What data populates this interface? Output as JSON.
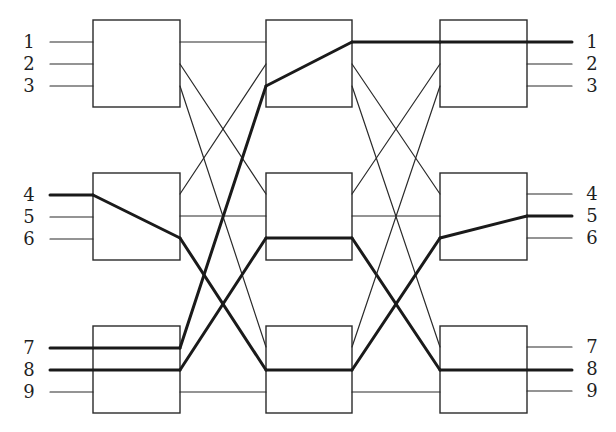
{
  "diagram": {
    "colors": {
      "line": "#2a2a2a",
      "highlight": "#1a1a1a",
      "background": "#ffffff"
    },
    "stages": [
      {
        "name": "input-stage",
        "switches": [
          {
            "id": "L1",
            "x": 93,
            "y": 20,
            "w": 87,
            "h": 87
          },
          {
            "id": "L2",
            "x": 93,
            "y": 173,
            "w": 87,
            "h": 87
          },
          {
            "id": "L3",
            "x": 93,
            "y": 326,
            "w": 87,
            "h": 87
          }
        ]
      },
      {
        "name": "middle-stage",
        "switches": [
          {
            "id": "M1",
            "x": 266,
            "y": 20,
            "w": 86,
            "h": 87
          },
          {
            "id": "M2",
            "x": 266,
            "y": 173,
            "w": 86,
            "h": 87
          },
          {
            "id": "M3",
            "x": 266,
            "y": 326,
            "w": 86,
            "h": 87
          }
        ]
      },
      {
        "name": "output-stage",
        "switches": [
          {
            "id": "R1",
            "x": 440,
            "y": 20,
            "w": 87,
            "h": 87
          },
          {
            "id": "R2",
            "x": 440,
            "y": 173,
            "w": 87,
            "h": 87
          },
          {
            "id": "R3",
            "x": 440,
            "y": 326,
            "w": 87,
            "h": 87
          }
        ]
      }
    ],
    "input_labels": [
      {
        "text": "1",
        "y": 42
      },
      {
        "text": "2",
        "y": 64
      },
      {
        "text": "3",
        "y": 86
      },
      {
        "text": "4",
        "y": 195
      },
      {
        "text": "5",
        "y": 217
      },
      {
        "text": "6",
        "y": 239
      },
      {
        "text": "7",
        "y": 348
      },
      {
        "text": "8",
        "y": 370
      },
      {
        "text": "9",
        "y": 392
      }
    ],
    "output_labels": [
      {
        "text": "1",
        "y": 42
      },
      {
        "text": "2",
        "y": 64
      },
      {
        "text": "3",
        "y": 86
      },
      {
        "text": "4",
        "y": 194
      },
      {
        "text": "5",
        "y": 216
      },
      {
        "text": "6",
        "y": 238
      },
      {
        "text": "7",
        "y": 347
      },
      {
        "text": "8",
        "y": 369
      },
      {
        "text": "9",
        "y": 391
      }
    ],
    "label_x": {
      "left": 29,
      "right": 592
    },
    "wires": [
      {
        "x1": 50,
        "y1": 42,
        "x2": 93,
        "y2": 42,
        "thick": false
      },
      {
        "x1": 50,
        "y1": 64,
        "x2": 93,
        "y2": 64,
        "thick": false
      },
      {
        "x1": 50,
        "y1": 86,
        "x2": 93,
        "y2": 86,
        "thick": false
      },
      {
        "x1": 50,
        "y1": 195,
        "x2": 93,
        "y2": 195,
        "thick": true
      },
      {
        "x1": 50,
        "y1": 217,
        "x2": 93,
        "y2": 217,
        "thick": false
      },
      {
        "x1": 50,
        "y1": 239,
        "x2": 93,
        "y2": 239,
        "thick": false
      },
      {
        "x1": 50,
        "y1": 348,
        "x2": 180,
        "y2": 348,
        "thick": true
      },
      {
        "x1": 50,
        "y1": 370,
        "x2": 180,
        "y2": 370,
        "thick": true
      },
      {
        "x1": 50,
        "y1": 392,
        "x2": 93,
        "y2": 392,
        "thick": false
      },
      {
        "x1": 93,
        "y1": 195,
        "x2": 180,
        "y2": 238,
        "thick": true
      },
      {
        "x1": 180,
        "y1": 42,
        "x2": 266,
        "y2": 42,
        "thick": false
      },
      {
        "x1": 180,
        "y1": 64,
        "x2": 266,
        "y2": 194,
        "thick": false
      },
      {
        "x1": 180,
        "y1": 86,
        "x2": 266,
        "y2": 347,
        "thick": false
      },
      {
        "x1": 180,
        "y1": 194,
        "x2": 266,
        "y2": 64,
        "thick": false
      },
      {
        "x1": 180,
        "y1": 216,
        "x2": 266,
        "y2": 216,
        "thick": false
      },
      {
        "x1": 180,
        "y1": 238,
        "x2": 266,
        "y2": 370,
        "thick": true
      },
      {
        "x1": 180,
        "y1": 348,
        "x2": 266,
        "y2": 86,
        "thick": true
      },
      {
        "x1": 180,
        "y1": 370,
        "x2": 266,
        "y2": 238,
        "thick": true
      },
      {
        "x1": 180,
        "y1": 392,
        "x2": 266,
        "y2": 392,
        "thick": false
      },
      {
        "x1": 266,
        "y1": 86,
        "x2": 352,
        "y2": 42,
        "thick": true
      },
      {
        "x1": 266,
        "y1": 238,
        "x2": 352,
        "y2": 238,
        "thick": true
      },
      {
        "x1": 266,
        "y1": 370,
        "x2": 352,
        "y2": 370,
        "thick": true
      },
      {
        "x1": 352,
        "y1": 42,
        "x2": 440,
        "y2": 42,
        "thick": true
      },
      {
        "x1": 352,
        "y1": 64,
        "x2": 440,
        "y2": 194,
        "thick": false
      },
      {
        "x1": 352,
        "y1": 86,
        "x2": 440,
        "y2": 347,
        "thick": false
      },
      {
        "x1": 352,
        "y1": 194,
        "x2": 440,
        "y2": 64,
        "thick": false
      },
      {
        "x1": 352,
        "y1": 216,
        "x2": 440,
        "y2": 216,
        "thick": false
      },
      {
        "x1": 352,
        "y1": 238,
        "x2": 440,
        "y2": 370,
        "thick": true
      },
      {
        "x1": 352,
        "y1": 347,
        "x2": 440,
        "y2": 86,
        "thick": false
      },
      {
        "x1": 352,
        "y1": 370,
        "x2": 440,
        "y2": 238,
        "thick": true
      },
      {
        "x1": 352,
        "y1": 392,
        "x2": 440,
        "y2": 392,
        "thick": false
      },
      {
        "x1": 440,
        "y1": 42,
        "x2": 572,
        "y2": 42,
        "thick": true
      },
      {
        "x1": 440,
        "y1": 238,
        "x2": 527,
        "y2": 216,
        "thick": true
      },
      {
        "x1": 440,
        "y1": 370,
        "x2": 572,
        "y2": 370,
        "thick": true
      },
      {
        "x1": 527,
        "y1": 64,
        "x2": 572,
        "y2": 64,
        "thick": false
      },
      {
        "x1": 527,
        "y1": 86,
        "x2": 572,
        "y2": 86,
        "thick": false
      },
      {
        "x1": 527,
        "y1": 194,
        "x2": 572,
        "y2": 194,
        "thick": false
      },
      {
        "x1": 527,
        "y1": 216,
        "x2": 572,
        "y2": 216,
        "thick": true
      },
      {
        "x1": 527,
        "y1": 238,
        "x2": 572,
        "y2": 238,
        "thick": false
      },
      {
        "x1": 527,
        "y1": 347,
        "x2": 572,
        "y2": 347,
        "thick": false
      },
      {
        "x1": 527,
        "y1": 391,
        "x2": 572,
        "y2": 391,
        "thick": false
      }
    ],
    "highlighted_paths": [
      {
        "from": "7",
        "to": "1",
        "via": [
          "L3",
          "M1",
          "R1"
        ]
      },
      {
        "from": "4",
        "to": "8",
        "via": [
          "L2",
          "M3",
          "R3"
        ]
      },
      {
        "from": "8",
        "to": "5",
        "via": [
          "L3",
          "M2",
          "R2"
        ]
      }
    ]
  }
}
